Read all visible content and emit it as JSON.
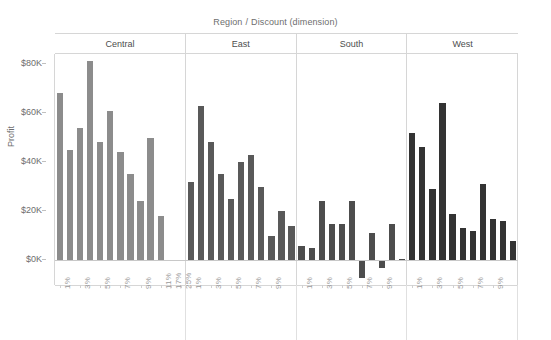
{
  "header": {
    "column_field_label": "Region",
    "separator": "/",
    "row_field_label": "Discount (dimension)",
    "panels": [
      "Central",
      "East",
      "South",
      "West"
    ]
  },
  "axes": {
    "y_title": "Profit",
    "y_ticks": [
      "$0K",
      "$20K",
      "$40K",
      "$60K",
      "$80K"
    ],
    "y_tick_values": [
      0,
      20000,
      40000,
      60000,
      80000
    ],
    "y_min": -10000,
    "y_max": 84000,
    "x_title": ""
  },
  "colors": {
    "central_bar": "#8c8c8c",
    "east_bar": "#595959",
    "south_bar": "#4d4d4d",
    "west_bar": "#333333",
    "gridline": "#d6d6d6",
    "text": "#6e6e6e",
    "background": "#ffffff"
  },
  "chart_data": {
    "type": "bar",
    "xlabel": "Discount (dimension)",
    "ylabel": "Profit",
    "ylim": [
      -10000,
      84000
    ],
    "grid": false,
    "legend": "none",
    "panel_layout": "columns",
    "panels": [
      {
        "name": "Central",
        "color": "#8c8c8c",
        "categories": [
          "1%",
          "2%",
          "3%",
          "4%",
          "5%",
          "6%",
          "7%",
          "8%",
          "9%",
          "10%",
          "11%",
          "17%",
          "25%"
        ],
        "tick_labels": [
          "1%",
          "",
          "3%",
          "",
          "5%",
          "",
          "7%",
          "",
          "9%",
          "",
          "11%",
          "17%",
          "25%"
        ],
        "values": [
          68000,
          45000,
          54000,
          81000,
          48000,
          61000,
          44000,
          35000,
          24000,
          50000,
          18000,
          300,
          200
        ]
      },
      {
        "name": "East",
        "color": "#595959",
        "categories": [
          "1%",
          "2%",
          "3%",
          "4%",
          "5%",
          "6%",
          "7%",
          "8%",
          "9%",
          "10%",
          "11%"
        ],
        "tick_labels": [
          "1%",
          "",
          "3%",
          "",
          "5%",
          "",
          "7%",
          "",
          "9%",
          "",
          ""
        ],
        "values": [
          32000,
          63000,
          48000,
          35000,
          25000,
          40000,
          43000,
          30000,
          10000,
          20000,
          14000
        ]
      },
      {
        "name": "South",
        "color": "#4d4d4d",
        "categories": [
          "1%",
          "2%",
          "3%",
          "4%",
          "5%",
          "6%",
          "7%",
          "8%",
          "9%",
          "10%",
          "11%"
        ],
        "tick_labels": [
          "1%",
          "",
          "3%",
          "",
          "5%",
          "",
          "7%",
          "",
          "9%",
          "",
          ""
        ],
        "values": [
          6000,
          5000,
          24000,
          15000,
          15000,
          24000,
          -7000,
          11000,
          -3000,
          15000,
          500
        ]
      },
      {
        "name": "West",
        "color": "#333333",
        "categories": [
          "1%",
          "2%",
          "3%",
          "4%",
          "5%",
          "6%",
          "7%",
          "8%",
          "9%",
          "10%",
          "11%"
        ],
        "tick_labels": [
          "1%",
          "",
          "3%",
          "",
          "5%",
          "",
          "7%",
          "",
          "9%",
          "",
          ""
        ],
        "values": [
          52000,
          46000,
          29000,
          64000,
          19000,
          13000,
          12000,
          31000,
          17000,
          16000,
          8000
        ]
      }
    ]
  }
}
